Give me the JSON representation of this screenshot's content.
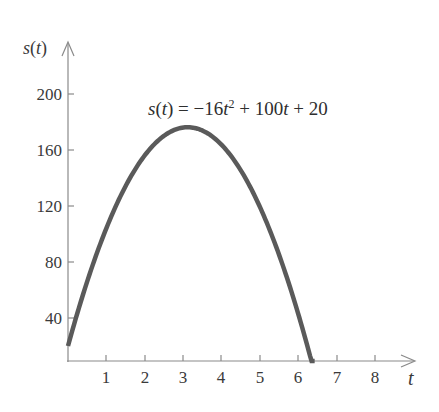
{
  "chart_data": {
    "type": "line",
    "title": "",
    "equation": "s(t) = −16t² + 100t + 20",
    "xlabel": "t",
    "ylabel": "s(t)",
    "xlim": [
      0,
      9
    ],
    "ylim": [
      0,
      220
    ],
    "grid": false,
    "legend": "none",
    "x_ticks": [
      1,
      2,
      3,
      4,
      5,
      6,
      7,
      8
    ],
    "y_ticks": [
      40,
      80,
      120,
      160,
      200
    ],
    "series": [
      {
        "name": "s(t) = -16t^2 + 100t + 20",
        "x": [
          0,
          0.5,
          1,
          1.5,
          2,
          2.5,
          3,
          3.125,
          3.5,
          4,
          4.5,
          5,
          5.5,
          6,
          6.44
        ],
        "values": [
          20,
          66,
          104,
          134,
          156,
          170,
          176,
          176.25,
          174,
          164,
          146,
          120,
          86,
          44,
          0
        ]
      }
    ]
  },
  "labels": {
    "y_axis": {
      "s": "s",
      "paren_open": "(",
      "t": "t",
      "paren_close": ")"
    },
    "x_axis": "t",
    "equation": {
      "lhs_s": "s",
      "lhs_open": "(",
      "lhs_t": "t",
      "lhs_close": ")",
      "middle": " = −16",
      "t1": "t",
      "exp": "2",
      "rest1": " + 100",
      "t2": "t",
      "rest2": " + 20"
    },
    "y_ticks": [
      "200",
      "160",
      "120",
      "80",
      "40"
    ],
    "x_ticks": [
      "1",
      "2",
      "3",
      "4",
      "5",
      "6",
      "7",
      "8"
    ]
  },
  "colors": {
    "curve": "#5a5a5a",
    "axis": "#8a8a8a",
    "text": "#333333"
  }
}
